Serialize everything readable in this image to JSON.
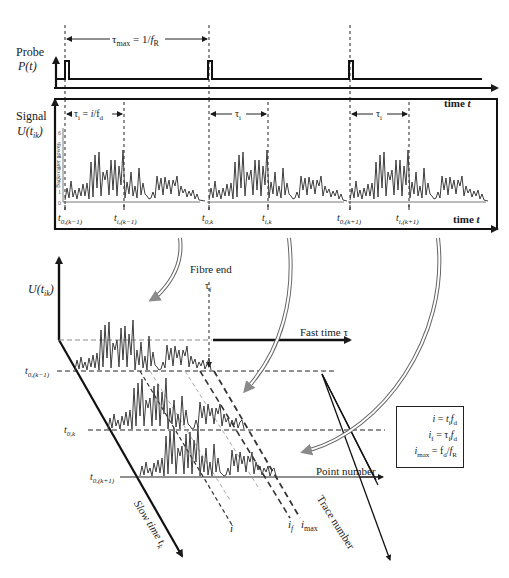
{
  "probe_panel": {
    "label_line1": "Probe",
    "label_line2": "P(t)",
    "tau_max_label": "τmax = 1/fR",
    "time_axis_label": "time t"
  },
  "signal_panel": {
    "label_line1": "Signal",
    "label_line2": "U(tik)",
    "tau_i_label": "τi = i/fd",
    "tau_i_label_2": "τi",
    "tau_i_label_3": "τi",
    "y_axis_title": "Backscatter power",
    "y_ticks": [
      "0",
      "1",
      "2",
      "3",
      "4",
      "5",
      "6"
    ],
    "time_axis_label": "time t",
    "tick_labels": [
      "t0,(k−1)",
      "ti,(k−1)",
      "t0,k",
      "ti,k",
      "t0,(k+1)",
      "ti,(k+1)"
    ]
  },
  "waterfall": {
    "y_axis_label": "U(tik)",
    "fibre_end_label": "Fibre end",
    "tau_f_label": "τf",
    "fast_time_label": "Fast time τ",
    "point_number_label": "Point number",
    "trace_number_label": "Trace number",
    "slow_time_label": "Slow time tk",
    "row_labels": [
      "t0,(k−1)",
      "t0,k",
      "t0,(k+1)"
    ],
    "index_labels": [
      "i",
      "if",
      "imax"
    ]
  },
  "formula_box": {
    "line1": "i = tifd",
    "line2": "if = τffd",
    "line3": "imax = fd/fR"
  },
  "colors": {
    "ink": "#1a1a1a",
    "trace": "#4a4a4a",
    "arrow_fill": "#8a8a8a",
    "dashed_light": "#9a9a9a"
  }
}
